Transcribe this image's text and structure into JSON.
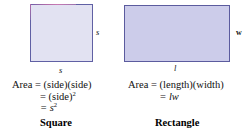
{
  "figure": {
    "panels": [
      {
        "id": "square",
        "caption": "Square",
        "shape": {
          "name": "square-shape",
          "fill": "#e2e2f2",
          "stroke": "#6060a4",
          "accent_stroke": "#b06ba8"
        },
        "labels": {
          "right": "s",
          "bottom": "s"
        },
        "formula": {
          "line1": "Area = (side)(side)",
          "line2_lead": "= (side)",
          "line2_exp": "2",
          "line3_lead": "= s",
          "line3_exp": "2"
        }
      },
      {
        "id": "rectangle",
        "caption": "Rectangle",
        "shape": {
          "name": "rectangle-shape",
          "fill": "#ccccea",
          "stroke": "#5b5b9e"
        },
        "labels": {
          "right": "w",
          "bottom": "l"
        },
        "formula": {
          "line1": "Area = (length)(width)",
          "line2_lead": "=",
          "line2_var": "lw"
        }
      }
    ]
  }
}
